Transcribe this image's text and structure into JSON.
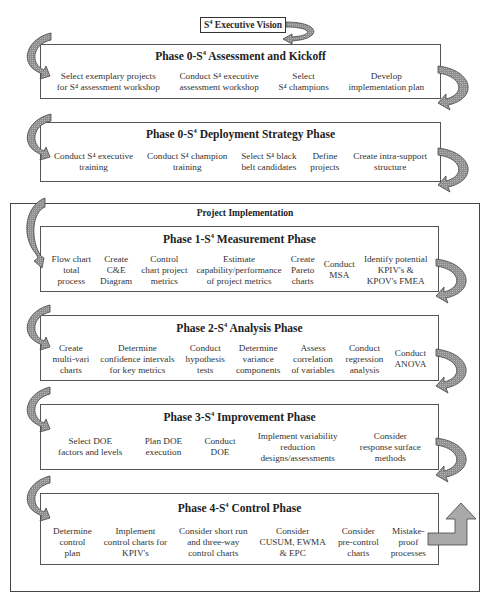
{
  "exec_vision": {
    "prefix": "S",
    "sup": "4",
    "rest": " Executive Vision"
  },
  "outer": {
    "title": "Project Implementation"
  },
  "phases": [
    {
      "title_prefix": "Phase 0-S",
      "title_sup": "4",
      "title_rest": " Assessment and Kickoff",
      "items": [
        {
          "l1": "Select exemplary projects",
          "l2": "for S⁴ assessment workshop"
        },
        {
          "l1": "Conduct S⁴ executive",
          "l2": "assessment workshop"
        },
        {
          "l1": "Select",
          "l2": "S⁴ champions"
        },
        {
          "l1": "Develop",
          "l2": "implementation plan"
        }
      ]
    },
    {
      "title_prefix": "Phase 0-S",
      "title_sup": "4",
      "title_rest": " Deployment Strategy Phase",
      "items": [
        {
          "l1": "Conduct S⁴ executive",
          "l2": "training"
        },
        {
          "l1": "Conduct S⁴ champion",
          "l2": "training"
        },
        {
          "l1": "Select S⁴ black",
          "l2": "belt candidates"
        },
        {
          "l1": "Define",
          "l2": "projects"
        },
        {
          "l1": "Create intra-support",
          "l2": "structure"
        }
      ]
    },
    {
      "title_prefix": "Phase 1-S",
      "title_sup": "4",
      "title_rest": " Measurement Phase",
      "items": [
        {
          "l1": "Flow chart",
          "l2": "total",
          "l3": "process"
        },
        {
          "l1": "Create",
          "l2": "C&E",
          "l3": "Diagram"
        },
        {
          "l1": "Control",
          "l2": "chart project",
          "l3": "metrics"
        },
        {
          "l1": "Estimate",
          "l2": "capability/performance",
          "l3": "of project metrics"
        },
        {
          "l1": "Create",
          "l2": "Pareto",
          "l3": "charts"
        },
        {
          "l1": "Conduct",
          "l2": "MSA"
        },
        {
          "l1": "Identify potential",
          "l2": "KPIV's  &",
          "l3": "KPOV's FMEA"
        }
      ]
    },
    {
      "title_prefix": "Phase 2-S",
      "title_sup": "4",
      "title_rest": " Analysis Phase",
      "items": [
        {
          "l1": "Create",
          "l2": "multi-vari",
          "l3": "charts"
        },
        {
          "l1": "Determine",
          "l2": "confidence intervals",
          "l3": "for key metrics"
        },
        {
          "l1": "Conduct",
          "l2": "hypothesis",
          "l3": "tests"
        },
        {
          "l1": "Determine",
          "l2": "variance",
          "l3": "components"
        },
        {
          "l1": "Assess",
          "l2": "correlation",
          "l3": "of variables"
        },
        {
          "l1": "Conduct",
          "l2": "regression",
          "l3": "analysis"
        },
        {
          "l1": "Conduct",
          "l2": "ANOVA"
        }
      ]
    },
    {
      "title_prefix": "Phase 3-S",
      "title_sup": "4",
      "title_rest": " Improvement Phase",
      "items": [
        {
          "l1": "Select DOE",
          "l2": "factors and levels"
        },
        {
          "l1": "Plan DOE",
          "l2": "execution"
        },
        {
          "l1": "Conduct",
          "l2": "DOE"
        },
        {
          "l1": "Implement variability",
          "l2": "reduction",
          "l3": "designs/assessments"
        },
        {
          "l1": "Consider",
          "l2": "response surface",
          "l3": "methods"
        }
      ]
    },
    {
      "title_prefix": "Phase 4-S",
      "title_sup": "4",
      "title_rest": " Control Phase",
      "items": [
        {
          "l1": "Determine",
          "l2": "control",
          "l3": "plan"
        },
        {
          "l1": "Implement",
          "l2": "control charts for",
          "l3": "KPIV's"
        },
        {
          "l1": "Consider short run",
          "l2": "and three-way",
          "l3": "control charts"
        },
        {
          "l1": "Consider",
          "l2": "CUSUM, EWMA",
          "l3": "& EPC"
        },
        {
          "l1": "Consider",
          "l2": "pre-control",
          "l3": "charts"
        },
        {
          "l1": "Mistake-",
          "l2": "proof",
          "l3": "processes"
        }
      ]
    }
  ],
  "colors": {
    "arrow_fill": "#9a9a9a",
    "border": "#555555",
    "up_arrow_fill": "#aaaaaa"
  }
}
